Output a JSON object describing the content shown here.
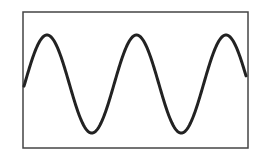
{
  "diagram": {
    "type": "sine-wave",
    "frame": {
      "x": 23,
      "y": 12,
      "width": 225,
      "height": 136,
      "stroke": "#444444",
      "stroke_width": 1.5
    },
    "wave": {
      "stroke": "#222222",
      "stroke_width": 3,
      "x_start": 24,
      "x_end": 246,
      "center_y": 84,
      "amplitude": 49,
      "period": 89.5,
      "first_peak_x": 47,
      "peaks": [
        [
          47,
          35
        ],
        [
          136,
          36
        ],
        [
          226,
          35
        ]
      ],
      "troughs": [
        [
          91,
          133
        ],
        [
          180,
          133
        ]
      ]
    }
  }
}
